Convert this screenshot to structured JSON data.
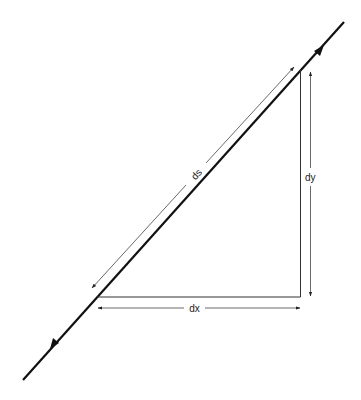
{
  "diagram": {
    "type": "differential-arc-length-triangle",
    "labels": {
      "ds": "ds",
      "dx": "dx",
      "dy": "dy"
    },
    "colors": {
      "background": "#ffffff",
      "line": "#111111",
      "dimension": "#333333"
    },
    "elements": [
      {
        "name": "curve-line",
        "description": "thick diagonal line with direction arrows"
      },
      {
        "name": "triangle-vertical-side"
      },
      {
        "name": "triangle-horizontal-side"
      },
      {
        "name": "ds-dimension-arrow",
        "label": "ds"
      },
      {
        "name": "dy-dimension-arrow",
        "label": "dy"
      },
      {
        "name": "dx-dimension-arrow",
        "label": "dx"
      }
    ]
  }
}
